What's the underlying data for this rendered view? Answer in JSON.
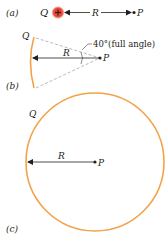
{
  "panels": {
    "a": {
      "label": "(a)",
      "charge_label": "Q",
      "charge_sign": "+",
      "distance_label": "R",
      "point_label": "P"
    },
    "b": {
      "label": "(b)",
      "charge_label": "Q",
      "distance_label": "R",
      "point_label": "P",
      "angle_annotation": "40°(full angle)"
    },
    "c": {
      "label": "(c)",
      "charge_label": "Q",
      "distance_label": "R",
      "point_label": "P"
    }
  },
  "colors": {
    "charge_fill": "#e8473c",
    "charge_stroke": "#f4a08a",
    "arc": "#f2a34a",
    "ink": "#231f20",
    "dashed": "#9a9a9a"
  }
}
